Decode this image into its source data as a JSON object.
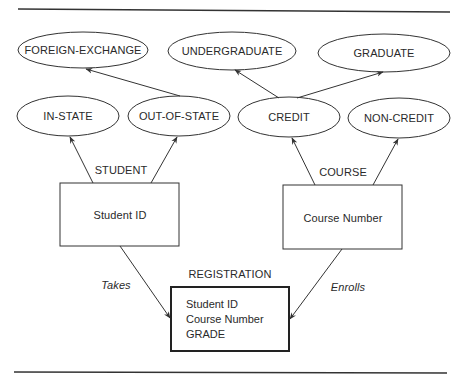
{
  "diagram": {
    "type": "entity-relationship",
    "attributes": {
      "foreign_exchange": "FOREIGN-EXCHANGE",
      "undergraduate": "UNDERGRADUATE",
      "graduate": "GRADUATE",
      "in_state": "IN-STATE",
      "out_of_state": "OUT-OF-STATE",
      "credit": "CREDIT",
      "non_credit": "NON-CREDIT"
    },
    "entities": {
      "student": {
        "name": "STUDENT",
        "key": "Student ID"
      },
      "course": {
        "name": "COURSE",
        "key": "Course Number"
      },
      "registration": {
        "name": "REGISTRATION",
        "fields": [
          "Student ID",
          "Course Number",
          "GRADE"
        ]
      }
    },
    "relationships": {
      "takes": "Takes",
      "enrolls": "Enrolls"
    },
    "colors": {
      "stroke": "#333333",
      "text": "#2a2a2a",
      "background": "#ffffff"
    }
  }
}
